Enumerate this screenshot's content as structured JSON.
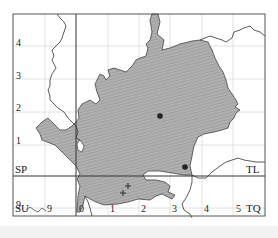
{
  "map": {
    "colors": {
      "frame": "#555555",
      "grid": "#e2e2e2",
      "county_fill": "#a9a9a9",
      "county_stroke": "#444444",
      "boundary": "#333333",
      "marker": "#222222"
    },
    "grid_square_labels": {
      "top_left": "SP",
      "top_right": "TL",
      "bottom_left": "SU",
      "bottom_right": "TQ"
    },
    "northing_labels": [
      "4",
      "3",
      "2",
      "1",
      "9"
    ],
    "easting_labels": [
      "9",
      "0",
      "1",
      "2",
      "3",
      "4",
      "5"
    ],
    "markers": {
      "dots": [
        {
          "x": 160,
          "y": 116
        },
        {
          "x": 185,
          "y": 167
        }
      ],
      "crosses": [
        {
          "x": 128,
          "y": 186
        },
        {
          "x": 123,
          "y": 193
        }
      ]
    }
  }
}
